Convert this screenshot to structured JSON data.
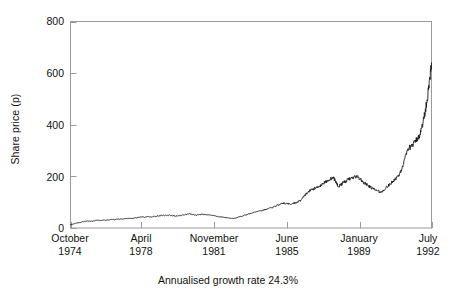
{
  "chart_data": {
    "type": "line",
    "title": "",
    "subtitle": "",
    "xlabel": "",
    "ylabel": "Share price (p)",
    "caption": "Annualised growth rate 24.3%",
    "ylim": [
      0,
      800
    ],
    "yticks": [
      0,
      200,
      400,
      600,
      800
    ],
    "ytick_labels": [
      "0",
      "200",
      "400",
      "600",
      "800"
    ],
    "xlim": [
      1974.79,
      1992.54
    ],
    "xticks": [
      1974.79,
      1978.25,
      1981.83,
      1985.42,
      1989.0,
      1992.54
    ],
    "xtick_labels": [
      {
        "month": "October",
        "year": "1974"
      },
      {
        "month": "April",
        "year": "1978"
      },
      {
        "month": "November",
        "year": "1981"
      },
      {
        "month": "June",
        "year": "1985"
      },
      {
        "month": "January",
        "year": "1989"
      },
      {
        "month": "July",
        "year": "1992"
      }
    ],
    "grid": false,
    "legend": null,
    "legend_position": "none",
    "line_color": "#1a1a1a",
    "frame_color": "#9a9a9a",
    "background": "#ffffff",
    "series": [
      {
        "name": "Share price",
        "units": "pence",
        "x": [
          1974.79,
          1974.95,
          1975.12,
          1975.29,
          1975.45,
          1975.62,
          1975.79,
          1975.95,
          1976.12,
          1976.29,
          1976.45,
          1976.62,
          1976.79,
          1976.95,
          1977.12,
          1977.29,
          1977.45,
          1977.62,
          1977.79,
          1977.95,
          1978.12,
          1978.29,
          1978.45,
          1978.62,
          1978.79,
          1978.95,
          1979.12,
          1979.29,
          1979.45,
          1979.62,
          1979.79,
          1979.95,
          1980.12,
          1980.29,
          1980.45,
          1980.62,
          1980.79,
          1980.95,
          1981.12,
          1981.29,
          1981.45,
          1981.62,
          1981.79,
          1981.95,
          1982.12,
          1982.29,
          1982.45,
          1982.62,
          1982.79,
          1982.95,
          1983.12,
          1983.29,
          1983.45,
          1983.62,
          1983.79,
          1983.95,
          1984.12,
          1984.29,
          1984.45,
          1984.62,
          1984.79,
          1984.95,
          1985.12,
          1985.29,
          1985.45,
          1985.62,
          1985.79,
          1985.95,
          1986.12,
          1986.25,
          1986.37,
          1986.5,
          1986.62,
          1986.75,
          1986.87,
          1986.95,
          1987.08,
          1987.2,
          1987.33,
          1987.45,
          1987.58,
          1987.7,
          1987.79,
          1987.87,
          1987.95,
          1988.08,
          1988.2,
          1988.33,
          1988.45,
          1988.58,
          1988.7,
          1988.83,
          1988.95,
          1989.08,
          1989.2,
          1989.33,
          1989.45,
          1989.58,
          1989.7,
          1989.83,
          1989.95,
          1990.08,
          1990.2,
          1990.33,
          1990.45,
          1990.58,
          1990.7,
          1990.83,
          1990.95,
          1991.08,
          1991.2,
          1991.33,
          1991.45,
          1991.58,
          1991.7,
          1991.83,
          1991.95,
          1992.04,
          1992.12,
          1992.2,
          1992.29,
          1992.37,
          1992.45,
          1992.54
        ],
        "y": [
          12,
          16,
          20,
          22,
          25,
          27,
          26,
          28,
          30,
          29,
          31,
          30,
          33,
          32,
          35,
          34,
          36,
          38,
          37,
          39,
          41,
          43,
          42,
          44,
          43,
          45,
          47,
          49,
          48,
          50,
          48,
          46,
          48,
          50,
          52,
          55,
          53,
          50,
          52,
          54,
          52,
          50,
          48,
          46,
          44,
          42,
          40,
          38,
          37,
          40,
          44,
          48,
          52,
          56,
          60,
          64,
          66,
          70,
          74,
          78,
          82,
          88,
          92,
          96,
          94,
          92,
          96,
          100,
          108,
          120,
          132,
          140,
          148,
          152,
          156,
          160,
          164,
          172,
          178,
          184,
          190,
          196,
          186,
          174,
          160,
          168,
          176,
          182,
          188,
          192,
          196,
          200,
          196,
          186,
          176,
          170,
          162,
          156,
          150,
          146,
          142,
          138,
          148,
          158,
          166,
          176,
          186,
          196,
          206,
          230,
          260,
          290,
          310,
          320,
          330,
          345,
          360,
          380,
          410,
          440,
          480,
          520,
          570,
          640
        ]
      }
    ]
  },
  "axis": {
    "ylabel": "Share price (p)",
    "ytick_labels": [
      "800",
      "600",
      "400",
      "200",
      "0"
    ],
    "xtick_months": [
      "October",
      "April",
      "November",
      "June",
      "January",
      "July"
    ],
    "xtick_years": [
      "1974",
      "1978",
      "1981",
      "1985",
      "1989",
      "1992"
    ]
  },
  "footer": {
    "caption": "Annualised growth rate 24.3%"
  }
}
